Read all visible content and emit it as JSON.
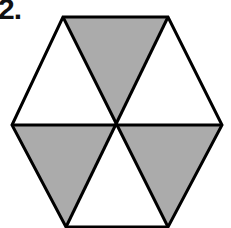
{
  "problem": {
    "number_label": "2."
  },
  "figure": {
    "shape": "regular hexagon divided into 6 equilateral triangles",
    "total_parts": 6,
    "shaded_parts": 3,
    "shaded_triangles": [
      "top",
      "bottom-left",
      "bottom-right"
    ],
    "unshaded_triangles": [
      "upper-left",
      "upper-right",
      "bottom"
    ],
    "colors": {
      "shade": "#ababab",
      "stroke": "#000000",
      "background": "#ffffff"
    }
  }
}
